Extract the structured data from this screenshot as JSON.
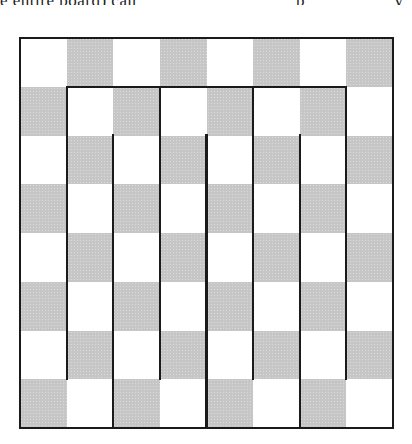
{
  "caption": {
    "text_left": "e entire board) can",
    "text_right_fragment_1": "p",
    "text_right_fragment_2": "y"
  },
  "board": {
    "rows": 8,
    "cols": 8,
    "top_left_color": "white",
    "colors": {
      "light": "#ffffff",
      "dark": "#c6c6c6",
      "line": "#1a1a1a"
    },
    "description": "8x8 checkerboard tiled by a single serpentine path of walls forming vertical strips"
  },
  "walls": {
    "outer_border": {
      "from": [
        0,
        0
      ],
      "to": [
        8,
        8
      ]
    },
    "horizontal": [
      {
        "row": 1,
        "col_start": 1,
        "col_end": 7
      }
    ],
    "vertical": [
      {
        "col": 1,
        "row_start": 1,
        "row_end": 7
      },
      {
        "col": 2,
        "row_start": 2,
        "row_end": 8
      },
      {
        "col": 3,
        "row_start": 1,
        "row_end": 7
      },
      {
        "col": 4,
        "row_start": 2,
        "row_end": 8
      },
      {
        "col": 5,
        "row_start": 1,
        "row_end": 7
      },
      {
        "col": 6,
        "row_start": 2,
        "row_end": 8
      },
      {
        "col": 7,
        "row_start": 1,
        "row_end": 7
      }
    ]
  }
}
